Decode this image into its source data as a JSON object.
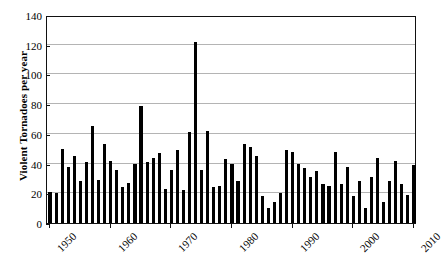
{
  "chart_data": {
    "type": "bar",
    "title": "",
    "xlabel": "",
    "ylabel": "Violent Tornadoes per year",
    "ylim": [
      0,
      140
    ],
    "yticks": [
      0,
      20,
      40,
      60,
      80,
      100,
      120,
      140
    ],
    "xticks": [
      1950,
      1960,
      1970,
      1980,
      1990,
      2000,
      2010
    ],
    "grid": true,
    "legend": null,
    "bar_color": "#000000",
    "categories": [
      1950,
      1951,
      1952,
      1953,
      1954,
      1955,
      1956,
      1957,
      1958,
      1959,
      1960,
      1961,
      1962,
      1963,
      1964,
      1965,
      1966,
      1967,
      1968,
      1969,
      1970,
      1971,
      1972,
      1973,
      1974,
      1975,
      1976,
      1977,
      1978,
      1979,
      1980,
      1981,
      1982,
      1983,
      1984,
      1985,
      1986,
      1987,
      1988,
      1989,
      1990,
      1991,
      1992,
      1993,
      1994,
      1995,
      1996,
      1997,
      1998,
      1999,
      2000,
      2001,
      2002,
      2003,
      2004,
      2005,
      2006,
      2007,
      2008,
      2009,
      2010
    ],
    "values": [
      21,
      20,
      50,
      38,
      45,
      28,
      41,
      65,
      29,
      53,
      42,
      36,
      24,
      27,
      40,
      79,
      41,
      44,
      47,
      23,
      36,
      49,
      22,
      61,
      122,
      36,
      62,
      24,
      25,
      43,
      40,
      28,
      53,
      51,
      45,
      18,
      10,
      14,
      20,
      49,
      48,
      40,
      37,
      31,
      35,
      26,
      25,
      48,
      26,
      38,
      18,
      28,
      10,
      31,
      44,
      14,
      28,
      42,
      26,
      19,
      39
    ]
  }
}
